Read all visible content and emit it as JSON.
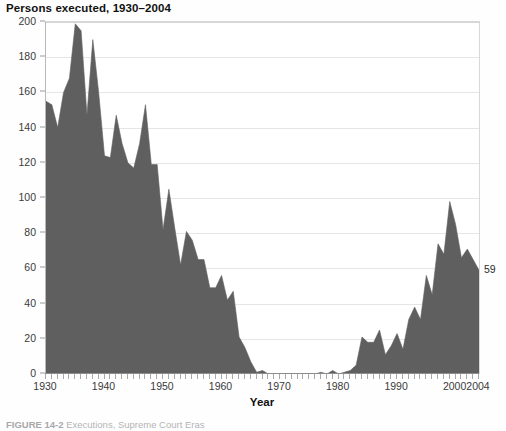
{
  "figure": {
    "title": "Persons executed, 1930–2004",
    "caption_number": "FIGURE 14-2",
    "caption_text": "Executions, Supreme Court Eras",
    "end_label": "59"
  },
  "axes": {
    "x_title": "Year",
    "x_tick_labels": [
      "1930",
      "1940",
      "1950",
      "1960",
      "1970",
      "1980",
      "1990",
      "2000",
      "2004"
    ],
    "x_tick_values": [
      1930,
      1940,
      1950,
      1960,
      1970,
      1980,
      1990,
      2000,
      2004
    ],
    "y_tick_labels": [
      "0",
      "20",
      "40",
      "60",
      "80",
      "100",
      "120",
      "140",
      "160",
      "180",
      "200"
    ],
    "y_tick_values": [
      0,
      20,
      40,
      60,
      80,
      100,
      120,
      140,
      160,
      180,
      200
    ]
  },
  "style": {
    "area_fill": "#5f5f5f",
    "grid_color": "#e6e6e6",
    "axis_color": "#8d8d8d",
    "text_color": "#3a3a3a",
    "plot_background": "#ffffff"
  },
  "chart_data": {
    "type": "area",
    "title": "Persons executed, 1930–2004",
    "xlabel": "Year",
    "ylabel": "Persons executed",
    "xlim": [
      1930,
      2004
    ],
    "ylim": [
      0,
      200
    ],
    "grid": true,
    "legend": "none",
    "annotations": [
      {
        "text": "59",
        "x": 2004,
        "y": 59
      }
    ],
    "x": [
      1930,
      1931,
      1932,
      1933,
      1934,
      1935,
      1936,
      1937,
      1938,
      1939,
      1940,
      1941,
      1942,
      1943,
      1944,
      1945,
      1946,
      1947,
      1948,
      1949,
      1950,
      1951,
      1952,
      1953,
      1954,
      1955,
      1956,
      1957,
      1958,
      1959,
      1960,
      1961,
      1962,
      1963,
      1964,
      1965,
      1966,
      1967,
      1968,
      1969,
      1970,
      1971,
      1972,
      1973,
      1974,
      1975,
      1976,
      1977,
      1978,
      1979,
      1980,
      1981,
      1982,
      1983,
      1984,
      1985,
      1986,
      1987,
      1988,
      1989,
      1990,
      1991,
      1992,
      1993,
      1994,
      1995,
      1996,
      1997,
      1998,
      1999,
      2000,
      2001,
      2002,
      2003,
      2004
    ],
    "values": [
      155,
      153,
      140,
      160,
      168,
      199,
      195,
      147,
      190,
      160,
      124,
      123,
      147,
      131,
      120,
      117,
      131,
      153,
      119,
      119,
      82,
      105,
      83,
      62,
      81,
      76,
      65,
      65,
      49,
      49,
      56,
      42,
      47,
      21,
      15,
      7,
      1,
      2,
      0,
      0,
      0,
      0,
      0,
      0,
      0,
      0,
      0,
      1,
      0,
      2,
      0,
      1,
      2,
      5,
      21,
      18,
      18,
      25,
      11,
      16,
      23,
      14,
      31,
      38,
      31,
      56,
      45,
      74,
      68,
      98,
      85,
      66,
      71,
      65,
      59
    ]
  }
}
